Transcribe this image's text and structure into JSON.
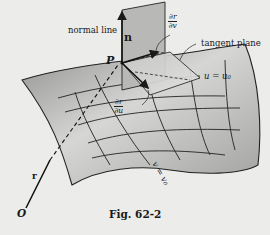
{
  "figure": {
    "caption": "Fig. 62-2",
    "labels": {
      "normal_line": "normal line",
      "tangent_plane": "tangent plane",
      "point": "P",
      "normal_vector": "n",
      "origin": "O",
      "position_vector": "r",
      "curve_u": "u = u₀",
      "curve_v": "v = v₀",
      "partial_r_v": {
        "numerator": "∂r",
        "denominator": "∂v"
      },
      "partial_r_u": {
        "numerator": "∂r",
        "denominator": "∂u"
      },
      "tangent_vector": "T"
    }
  },
  "colors": {
    "background": "#ececea",
    "ink": "#1a1a1a",
    "surface_light": "#d8d8d6",
    "surface_dark": "#9a9a98"
  }
}
